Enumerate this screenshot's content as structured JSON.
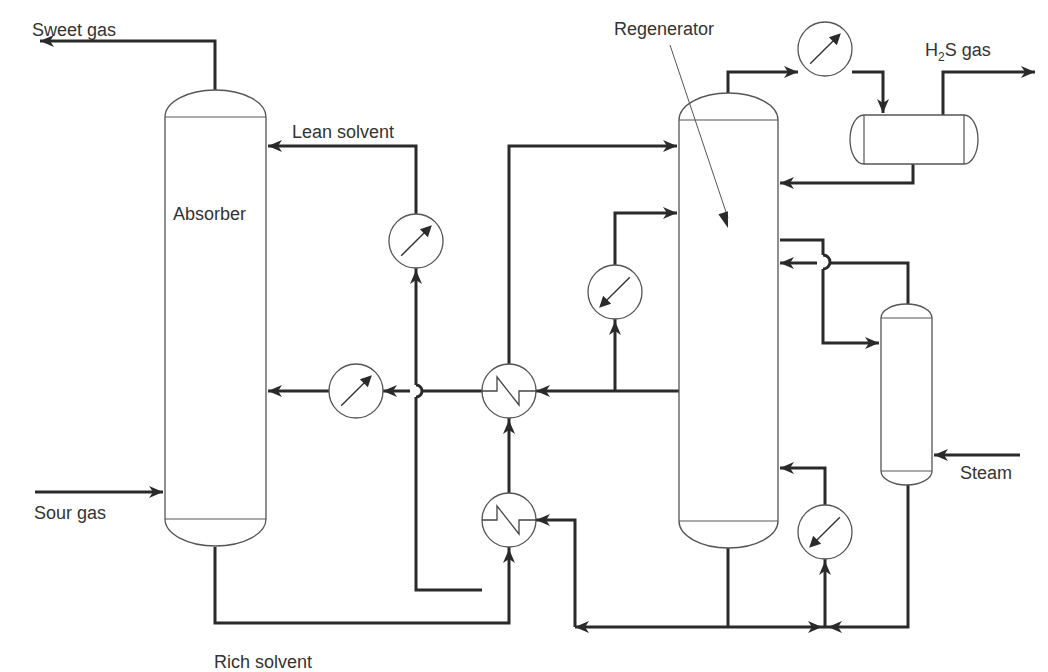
{
  "labels": {
    "sweet_gas": {
      "text": "Sweet gas",
      "x": 32,
      "y": 36
    },
    "lean_solvent": {
      "text": "Lean solvent",
      "x": 292,
      "y": 138
    },
    "absorber": {
      "text": "Absorber",
      "x": 173,
      "y": 220
    },
    "sour_gas": {
      "text": "Sour gas",
      "x": 34,
      "y": 519
    },
    "rich_solvent": {
      "text": "Rich solvent",
      "x": 214,
      "y": 668
    },
    "regenerator": {
      "text": "Regenerator",
      "x": 614,
      "y": 35
    },
    "h2s_gas": {
      "h": "H",
      "sub": "2",
      "rest": "S gas",
      "x": 925,
      "y": 56
    },
    "steam": {
      "text": "Steam",
      "x": 960,
      "y": 479
    }
  },
  "colors": {
    "pipe": "#2a2a2a",
    "vessel_outline": "#555555",
    "text": "#333333",
    "background": "#ffffff"
  },
  "vessels": [
    {
      "id": "absorber",
      "x": 165,
      "y": 117,
      "w": 101,
      "h": 402,
      "cap": 27
    },
    {
      "id": "regenerator",
      "x": 679,
      "y": 120,
      "w": 99,
      "h": 401,
      "cap": 27
    },
    {
      "id": "reboiler-column",
      "x": 881,
      "y": 318,
      "w": 51,
      "h": 153,
      "cap": 14
    }
  ],
  "drum": {
    "id": "reflux-drum",
    "x": 864,
    "y": 115,
    "w": 100,
    "h": 49,
    "cap": 14
  },
  "exchangers": [
    {
      "id": "lean-cooler-top",
      "type": "cooler",
      "cx": 416,
      "cy": 241,
      "r": 27,
      "dir": "up"
    },
    {
      "id": "lean-cooler-mid",
      "type": "cooler",
      "cx": 356,
      "cy": 391,
      "r": 27,
      "dir": "up"
    },
    {
      "id": "lean-rich-exchanger-1",
      "type": "exchanger",
      "cx": 509,
      "cy": 391,
      "r": 27
    },
    {
      "id": "lean-rich-exchanger-2",
      "type": "exchanger",
      "cx": 509,
      "cy": 520,
      "r": 27
    },
    {
      "id": "side-heater",
      "type": "heater",
      "cx": 615,
      "cy": 292,
      "r": 27,
      "dir": "down"
    },
    {
      "id": "overhead-condenser",
      "type": "cooler",
      "cx": 825,
      "cy": 49,
      "r": 27,
      "dir": "up"
    },
    {
      "id": "bottom-reboiler",
      "type": "heater",
      "cx": 825,
      "cy": 532,
      "r": 27,
      "dir": "down"
    }
  ],
  "pipes": [
    {
      "id": "sweet-gas-out",
      "d": "M215 90 L215 41 L40 41"
    },
    {
      "id": "lean-solvent-top",
      "d": "M416 214 L416 146 L268 146"
    },
    {
      "id": "lean-solvent-riser",
      "d": "M416 268 L416 385 M416 397 L416 590 L482 590"
    },
    {
      "id": "lean-to-cooler",
      "d": "M482 391 L422 391 M410 391 L383 391"
    },
    {
      "id": "cooler-to-absorber",
      "d": "M329 391 L268 391"
    },
    {
      "id": "regen-bottom-to-hx",
      "d": "M778 391 L536 391"
    },
    {
      "id": "hx-to-regen-top",
      "d": "M509 364 L509 146 L677 146"
    },
    {
      "id": "side-heater-loop",
      "d": "M615 391 L615 319 M615 265 L615 213 L677 213"
    },
    {
      "id": "rich-solvent",
      "d": "M215 547 L215 623 L509 623 L509 547"
    },
    {
      "id": "hx2-to-hx1",
      "d": "M509 493 L509 418"
    },
    {
      "id": "regen-hot-to-hx2",
      "d": "M536 520 L575 520 L575 627"
    },
    {
      "id": "regen-bottom-header",
      "d": "M728 548 L728 627 M575 627 L825 627"
    },
    {
      "id": "overhead-vapor",
      "d": "M728 93 L728 72 L798 72"
    },
    {
      "id": "condenser-to-drum",
      "d": "M852 72 L883 72 L883 113"
    },
    {
      "id": "h2s-out",
      "d": "M943 115 L943 72 L1035 72"
    },
    {
      "id": "drum-reflux",
      "d": "M913 164 L913 183 L780 183"
    },
    {
      "id": "regen-side-draw",
      "d": "M780 240 L823 240 L823 255 M823 269 L823 343 L879 343"
    },
    {
      "id": "stripper-return",
      "d": "M908 304 L908 263 L830 263 M817 263 L780 263"
    },
    {
      "id": "reboiler-return",
      "d": "M825 505 L825 468 L780 468"
    },
    {
      "id": "reboiler-feed",
      "d": "M825 559 L825 627"
    },
    {
      "id": "stripper-bottom",
      "d": "M908 485 L908 627 L825 627"
    },
    {
      "id": "steam-in",
      "d": "M1020 455 L934 455"
    },
    {
      "id": "sour-gas-in",
      "d": "M35 492 L163 492"
    }
  ],
  "jump_arcs": [
    {
      "id": "jump-lean-riser",
      "d": "M416 385 A6 6 0 0 1 416 397"
    },
    {
      "id": "jump-side-draw",
      "d": "M823 255 A7 7 0 0 1 823 269"
    }
  ],
  "arrows": [
    {
      "at": [
        40,
        41
      ],
      "dir": "left"
    },
    {
      "at": [
        268,
        146
      ],
      "dir": "left"
    },
    {
      "at": [
        416,
        270
      ],
      "dir": "up"
    },
    {
      "at": [
        383,
        391
      ],
      "dir": "left"
    },
    {
      "at": [
        268,
        391
      ],
      "dir": "left"
    },
    {
      "at": [
        536,
        391
      ],
      "dir": "left"
    },
    {
      "at": [
        677,
        146
      ],
      "dir": "right"
    },
    {
      "at": [
        677,
        213
      ],
      "dir": "right"
    },
    {
      "at": [
        615,
        321
      ],
      "dir": "up"
    },
    {
      "at": [
        509,
        420
      ],
      "dir": "up"
    },
    {
      "at": [
        509,
        549
      ],
      "dir": "up"
    },
    {
      "at": [
        536,
        520
      ],
      "dir": "left"
    },
    {
      "at": [
        575,
        627
      ],
      "dir": "left"
    },
    {
      "at": [
        822,
        627
      ],
      "dir": "right"
    },
    {
      "at": [
        828,
        627
      ],
      "dir": "left"
    },
    {
      "at": [
        825,
        561
      ],
      "dir": "up"
    },
    {
      "at": [
        798,
        72
      ],
      "dir": "right"
    },
    {
      "at": [
        883,
        113
      ],
      "dir": "down"
    },
    {
      "at": [
        1035,
        72
      ],
      "dir": "right"
    },
    {
      "at": [
        780,
        183
      ],
      "dir": "left"
    },
    {
      "at": [
        780,
        263
      ],
      "dir": "left"
    },
    {
      "at": [
        879,
        343
      ],
      "dir": "right"
    },
    {
      "at": [
        780,
        468
      ],
      "dir": "left"
    },
    {
      "at": [
        934,
        455
      ],
      "dir": "left"
    },
    {
      "at": [
        163,
        492
      ],
      "dir": "right"
    }
  ],
  "leader": {
    "x1": 670,
    "y1": 45,
    "x2": 728,
    "y2": 228
  }
}
